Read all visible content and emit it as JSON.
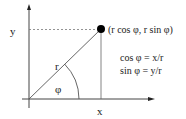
{
  "diagram": {
    "type": "polar-to-cartesian",
    "labels": {
      "y_axis": "y",
      "x_axis": "x",
      "radius": "r",
      "angle": "φ",
      "point": "(r cos φ, r sin φ)"
    },
    "equations": [
      "cos φ = x/r",
      "sin φ = y/r"
    ],
    "colors": {
      "line": "#444444",
      "dotted": "#777777",
      "point": "#000000",
      "text": "#222222"
    }
  }
}
